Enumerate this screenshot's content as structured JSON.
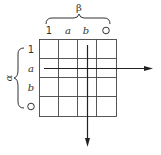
{
  "diagram": {
    "top_brace_label": "β",
    "left_brace_label": "α",
    "column_headers": [
      "1",
      "a",
      "b",
      "O"
    ],
    "row_headers": [
      "1",
      "a",
      "b",
      "O"
    ],
    "grid": {
      "rows": 4,
      "cols": 4
    },
    "arrows": [
      {
        "name": "horizontal-arrow",
        "direction": "right",
        "row": "a"
      },
      {
        "name": "vertical-arrow",
        "direction": "down",
        "column": "b"
      }
    ],
    "colors": {
      "line": "#333333",
      "background": "#ffffff"
    }
  }
}
